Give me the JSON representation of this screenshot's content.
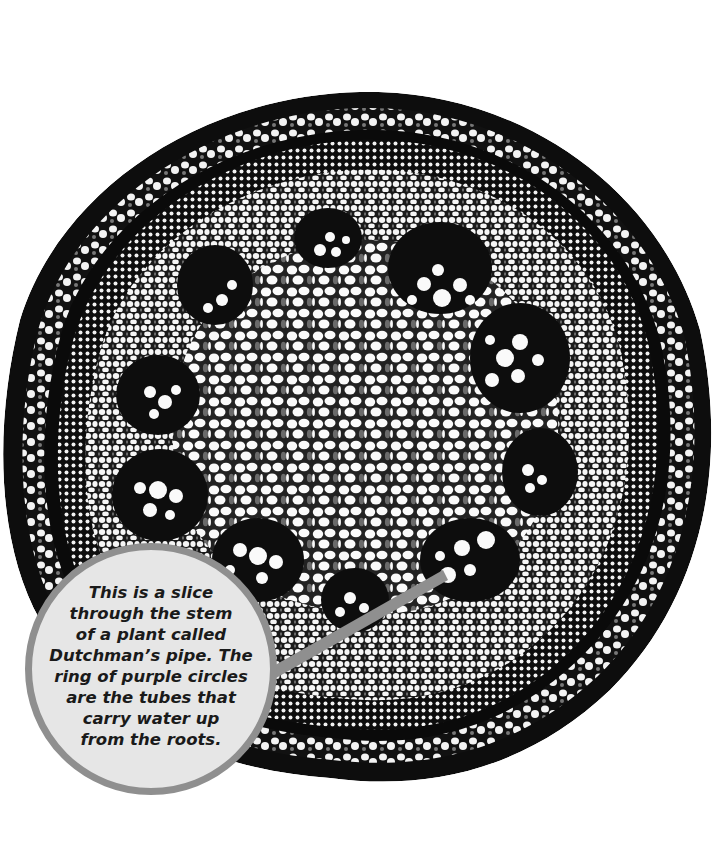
{
  "illustration": {
    "subject": "Cross-section of Dutchman's pipe stem",
    "colors": {
      "background": "#ffffff",
      "tissue_dark": "#0d0d0d",
      "tissue_light": "#f4f4f4",
      "stained_cells": "#6e6e6e",
      "callout_fill": "#e6e6e6",
      "callout_border": "#8f8f8f",
      "pointer": "#8f8f8f"
    }
  },
  "callout": {
    "lines": [
      "This is a slice",
      "through the stem",
      "of a plant called",
      "Dutchman’s pipe. The",
      "ring of purple circles",
      "are the tubes that",
      "carry water up",
      "from the roots."
    ]
  }
}
